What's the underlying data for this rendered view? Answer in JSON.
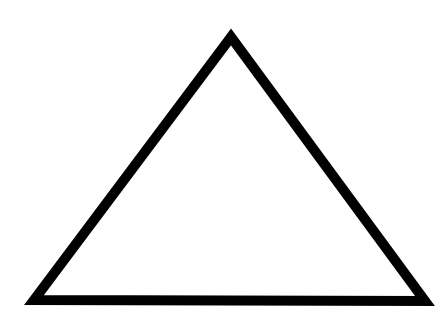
{
  "diagram": {
    "shape": "triangle",
    "fill": "#ffffff",
    "stroke": "#000000",
    "stroke_width": 10,
    "vertices": [
      [
        231,
        37
      ],
      [
        34,
        300
      ],
      [
        425,
        301
      ]
    ]
  }
}
